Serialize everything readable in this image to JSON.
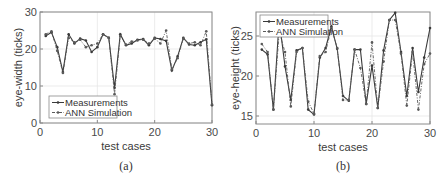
{
  "chart_data": [
    {
      "type": "line",
      "panel_caption": "(a)",
      "title": "",
      "xlabel": "test cases",
      "ylabel": "eye-width  (ticks)",
      "xlim": [
        0,
        30
      ],
      "ylim": [
        0,
        30
      ],
      "xticks": [
        0,
        10,
        20,
        30
      ],
      "yticks": [
        0,
        10,
        20,
        30
      ],
      "grid": true,
      "legend_position": "lower left",
      "x": [
        1,
        2,
        3,
        4,
        5,
        6,
        7,
        8,
        9,
        10,
        11,
        12,
        13,
        14,
        15,
        16,
        17,
        18,
        19,
        20,
        21,
        22,
        23,
        24,
        25,
        26,
        27,
        28,
        29,
        30
      ],
      "series": [
        {
          "name": "Measurements",
          "style": "solid, dot markers",
          "values": [
            23.5,
            24.5,
            20.5,
            13.8,
            24.0,
            21.5,
            22.8,
            22.3,
            19.2,
            20.5,
            24.0,
            23.0,
            9.5,
            24.0,
            21.0,
            21.5,
            22.5,
            22.7,
            21.0,
            23.0,
            22.7,
            22.2,
            14.2,
            18.0,
            23.0,
            21.2,
            21.0,
            21.8,
            22.6,
            4.8
          ]
        },
        {
          "name": "ANN Simulation",
          "style": "dash-dot, dot markers",
          "values": [
            24.0,
            24.8,
            19.5,
            13.5,
            23.0,
            21.8,
            22.5,
            20.5,
            21.0,
            21.5,
            24.0,
            23.0,
            7.8,
            23.5,
            21.2,
            22.0,
            22.3,
            22.5,
            21.5,
            22.8,
            21.5,
            25.0,
            14.5,
            17.5,
            22.8,
            21.5,
            21.8,
            21.0,
            24.8,
            5.0
          ]
        }
      ]
    },
    {
      "type": "line",
      "panel_caption": "(b)",
      "title": "",
      "xlabel": "test cases",
      "ylabel": "eye-height  (ticks)",
      "xlim": [
        0,
        30
      ],
      "ylim": [
        14,
        28
      ],
      "xticks": [
        0,
        10,
        20,
        30
      ],
      "yticks": [
        15,
        20,
        25
      ],
      "grid": true,
      "legend_position": "upper left",
      "x": [
        1,
        2,
        3,
        4,
        5,
        6,
        7,
        8,
        9,
        10,
        11,
        12,
        13,
        14,
        15,
        16,
        17,
        18,
        19,
        20,
        21,
        22,
        23,
        24,
        25,
        26,
        27,
        28,
        29,
        30
      ],
      "series": [
        {
          "name": "Measurements",
          "style": "solid, dot markers",
          "values": [
            23.3,
            22.7,
            15.8,
            27.0,
            21.2,
            17.0,
            23.2,
            23.5,
            15.8,
            15.2,
            22.3,
            23.5,
            26.2,
            23.4,
            17.5,
            16.9,
            23.3,
            23.3,
            16.5,
            21.3,
            16.0,
            23.2,
            27.0,
            27.9,
            23.0,
            17.5,
            23.5,
            18.0,
            22.3,
            26.0
          ]
        },
        {
          "name": "ANN Simulation",
          "style": "dash-dot, dot markers",
          "values": [
            24.0,
            23.0,
            15.8,
            25.5,
            23.0,
            16.2,
            23.0,
            23.5,
            16.8,
            15.3,
            22.5,
            23.0,
            26.0,
            23.5,
            17.0,
            17.0,
            23.3,
            21.0,
            16.5,
            24.2,
            16.0,
            21.8,
            27.0,
            27.0,
            22.8,
            16.3,
            23.0,
            15.8,
            21.5,
            22.8
          ]
        }
      ]
    }
  ],
  "legend": {
    "measurements": "Measurements",
    "ann": "ANN Simulation"
  },
  "colors": {
    "measurements": "#3a3a3a",
    "ann": "#5a5a5a",
    "axis": "#8a8a8a",
    "grid": "#e6e6e6"
  }
}
